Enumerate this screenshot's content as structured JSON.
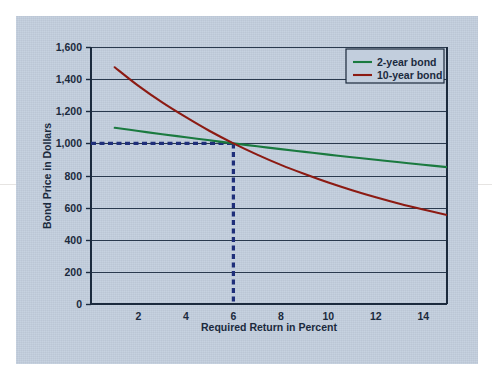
{
  "figure": {
    "panel_background_color": "#c2cedd",
    "page_background_color": "#ffffff"
  },
  "chart_data": {
    "type": "line",
    "title": "",
    "xlabel": "Required Return in Percent",
    "ylabel": "Bond Price in Dollars",
    "xlim": [
      0,
      15
    ],
    "ylim": [
      0,
      1600
    ],
    "xticks": [
      2,
      4,
      6,
      8,
      10,
      12,
      14
    ],
    "xtick_labels": [
      "2",
      "4",
      "6",
      "8",
      "10",
      "12",
      "14"
    ],
    "yticks": [
      0,
      200,
      400,
      600,
      800,
      1000,
      1200,
      1400,
      1600
    ],
    "ytick_labels": [
      "0",
      "200",
      "400",
      "600",
      "800",
      "1,000",
      "1,200",
      "1,400",
      "1,600"
    ],
    "grid": "horizontal",
    "legend_position": "top-right",
    "x": [
      1,
      2,
      3,
      4,
      5,
      6,
      7,
      8,
      9,
      10,
      11,
      12,
      13,
      14,
      15
    ],
    "series": [
      {
        "name": "2-year bond",
        "color": "#1a7a3f",
        "values": [
          1097,
          1077,
          1057,
          1038,
          1019,
          1000,
          982,
          964,
          947,
          930,
          914,
          898,
          882,
          867,
          852
        ]
      },
      {
        "name": "10-year bond",
        "color": "#8c1a12",
        "values": [
          1474,
          1358,
          1255,
          1163,
          1077,
          1000,
          930,
          866,
          809,
          756,
          708,
          664,
          624,
          588,
          554
        ]
      }
    ],
    "annotations": [
      {
        "name": "par-value-reference",
        "type": "dashed-guide",
        "color": "#1f2f7a",
        "x": 6,
        "y": 1000,
        "description": "Dashed guide from y-axis at 1,000 across to x = 6, then down to 0"
      }
    ]
  },
  "legend": {
    "items": [
      {
        "label": "2-year bond",
        "color": "#1a7a3f"
      },
      {
        "label": "10-year bond",
        "color": "#8c1a12"
      }
    ]
  },
  "axes": {
    "x_title": "Required Return in Percent",
    "y_title": "Bond Price in Dollars"
  }
}
